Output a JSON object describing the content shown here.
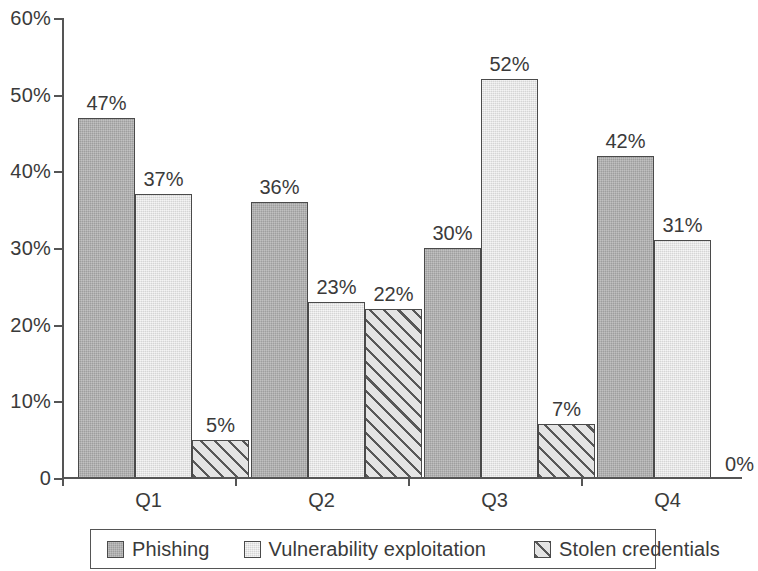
{
  "chart_data": {
    "type": "bar",
    "title": "",
    "subtitle": "",
    "xlabel": "",
    "ylabel": "",
    "categories": [
      "Q1",
      "Q2",
      "Q3",
      "Q4"
    ],
    "series": [
      {
        "name": "Phishing",
        "values": [
          47,
          36,
          30,
          42
        ],
        "pattern": "solid-dark",
        "color": "#b0b0b0"
      },
      {
        "name": "Vulnerability exploitation",
        "values": [
          37,
          23,
          52,
          31
        ],
        "pattern": "solid-light",
        "color": "#e7e7e7"
      },
      {
        "name": "Stolen credentials",
        "values": [
          5,
          22,
          7,
          0
        ],
        "pattern": "diagonal-hatch",
        "color": "#e4e4e4"
      }
    ],
    "value_labels": [
      [
        "47%",
        "37%",
        "5%"
      ],
      [
        "36%",
        "23%",
        "22%"
      ],
      [
        "30%",
        "52%",
        "7%"
      ],
      [
        "42%",
        "31%",
        "0%"
      ]
    ],
    "ylim": [
      0,
      60
    ],
    "y_ticks": [
      0,
      10,
      20,
      30,
      40,
      50,
      60
    ],
    "y_tick_labels": [
      "0",
      "10%",
      "20%",
      "30%",
      "40%",
      "50%",
      "60%"
    ],
    "grid": false,
    "legend_position": "bottom"
  },
  "axes": {
    "y_ticks": [
      {
        "value": 60,
        "label": "60%"
      },
      {
        "value": 50,
        "label": "50%"
      },
      {
        "value": 40,
        "label": "40%"
      },
      {
        "value": 30,
        "label": "30%"
      },
      {
        "value": 20,
        "label": "20%"
      },
      {
        "value": 10,
        "label": "10%"
      },
      {
        "value": 0,
        "label": "0"
      }
    ],
    "x_categories": [
      {
        "label": "Q1"
      },
      {
        "label": "Q2"
      },
      {
        "label": "Q3"
      },
      {
        "label": "Q4"
      }
    ]
  },
  "legend": {
    "items": [
      {
        "label": "Phishing",
        "pattern": "solid-dark"
      },
      {
        "label": "Vulnerability exploitation",
        "pattern": "solid-light"
      },
      {
        "label": "Stolen credentials",
        "pattern": "diagonal-hatch"
      }
    ]
  },
  "bars": {
    "Q1": [
      {
        "series": "Phishing",
        "value": 47,
        "label": "47%"
      },
      {
        "series": "Vulnerability exploitation",
        "value": 37,
        "label": "37%"
      },
      {
        "series": "Stolen credentials",
        "value": 5,
        "label": "5%"
      }
    ],
    "Q2": [
      {
        "series": "Phishing",
        "value": 36,
        "label": "36%"
      },
      {
        "series": "Vulnerability exploitation",
        "value": 23,
        "label": "23%"
      },
      {
        "series": "Stolen credentials",
        "value": 22,
        "label": "22%"
      }
    ],
    "Q3": [
      {
        "series": "Phishing",
        "value": 30,
        "label": "30%"
      },
      {
        "series": "Vulnerability exploitation",
        "value": 52,
        "label": "52%"
      },
      {
        "series": "Stolen credentials",
        "value": 7,
        "label": "7%"
      }
    ],
    "Q4": [
      {
        "series": "Phishing",
        "value": 42,
        "label": "42%"
      },
      {
        "series": "Vulnerability exploitation",
        "value": 31,
        "label": "31%"
      },
      {
        "series": "Stolen credentials",
        "value": 0,
        "label": "0%"
      }
    ]
  },
  "colors": {
    "series_phishing": "#b0b0b0",
    "series_vulnerability": "#e7e7e7",
    "series_stolen": "#e4e4e4",
    "axis": "#555555",
    "text": "#3a3a3a",
    "background": "#ffffff"
  }
}
